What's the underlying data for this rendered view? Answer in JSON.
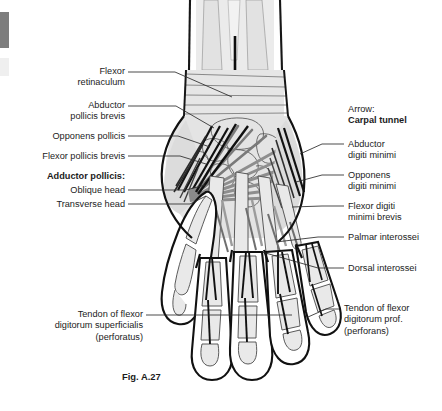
{
  "figure": {
    "caption": "Fig. A.27",
    "caption_x": 122,
    "caption_y": 371
  },
  "colors": {
    "background": "#ffffff",
    "text": "#1c1c1c",
    "outline": "#111111",
    "bone_fill": "#e9e9e9",
    "bone_line": "#4a4a4a",
    "muscle_gray": "#8c8c8c",
    "tendon_dark": "#141414",
    "leader": "#2a2a2a",
    "scan_artifact": "#7d7d7d"
  },
  "labels_left": [
    {
      "name": "flexor-retinaculum",
      "text": "Flexor\nretinaculum",
      "x": 18,
      "y": 66,
      "w": 107,
      "bold": false,
      "leader": [
        [
          128,
          72
        ],
        [
          175,
          72
        ],
        [
          232,
          97
        ]
      ]
    },
    {
      "name": "abductor-pollicis-brevis",
      "text": "Abductor\npollicis brevis",
      "x": 18,
      "y": 100,
      "w": 107,
      "bold": false,
      "leader": [
        [
          128,
          106
        ],
        [
          176,
          106
        ],
        [
          214,
          128
        ]
      ]
    },
    {
      "name": "opponens-pollicis",
      "text": "Opponens pollicis",
      "x": 18,
      "y": 131,
      "w": 107,
      "bold": false,
      "leader": [
        [
          128,
          136
        ],
        [
          178,
          136
        ],
        [
          210,
          147
        ]
      ]
    },
    {
      "name": "flexor-pollicis-brevis",
      "text": "Flexor pollicis brevis",
      "x": 12,
      "y": 151,
      "w": 113,
      "bold": false,
      "leader": [
        [
          128,
          156
        ],
        [
          180,
          156
        ],
        [
          206,
          164
        ]
      ]
    },
    {
      "name": "adductor-pollicis-heading",
      "text": "Adductor pollicis:",
      "x": 18,
      "y": 171,
      "w": 107,
      "bold": true,
      "leader": null
    },
    {
      "name": "adductor-pollicis-oblique-head",
      "text": "Oblique head",
      "x": 18,
      "y": 185,
      "w": 107,
      "bold": false,
      "leader": [
        [
          128,
          190
        ],
        [
          186,
          190
        ],
        [
          205,
          185
        ]
      ]
    },
    {
      "name": "adductor-pollicis-transverse-head",
      "text": "Transverse head",
      "x": 18,
      "y": 199,
      "w": 107,
      "bold": false,
      "leader": [
        [
          128,
          204
        ],
        [
          190,
          204
        ],
        [
          206,
          196
        ]
      ]
    }
  ],
  "labels_right": [
    {
      "name": "arrow-carpal-tunnel",
      "text_plain": "Arrow:",
      "text_bold": "Carpal tunnel",
      "x": 348,
      "y": 104,
      "w": 92,
      "leader": null
    },
    {
      "name": "abductor-digiti-minimi",
      "text": "Abductor\ndigiti minimi",
      "x": 348,
      "y": 139,
      "w": 92,
      "leader": [
        [
          344,
          144
        ],
        [
          322,
          144
        ],
        [
          300,
          154
        ]
      ]
    },
    {
      "name": "opponens-digiti-minimi",
      "text": "Opponens\ndigiti minimi",
      "x": 348,
      "y": 170,
      "w": 92,
      "leader": [
        [
          344,
          175
        ],
        [
          322,
          175
        ],
        [
          296,
          182
        ]
      ]
    },
    {
      "name": "flexor-digiti-minimi-brevis",
      "text": "Flexor digiti\nminimi brevis",
      "x": 348,
      "y": 201,
      "w": 92,
      "leader": [
        [
          344,
          206
        ],
        [
          322,
          206
        ],
        [
          292,
          207
        ]
      ]
    },
    {
      "name": "palmar-interossei",
      "text": "Palmar interossei",
      "x": 348,
      "y": 232,
      "w": 92,
      "leader": [
        [
          344,
          237
        ],
        [
          318,
          237
        ],
        [
          276,
          242
        ]
      ]
    },
    {
      "name": "dorsal-interossei",
      "text": "Dorsal interossei",
      "x": 348,
      "y": 263,
      "w": 92,
      "leader": [
        [
          344,
          268
        ],
        [
          318,
          268
        ],
        [
          262,
          252
        ]
      ]
    }
  ],
  "labels_bottom": [
    {
      "name": "tendon-flexor-digitorum-superficialis",
      "text": "Tendon of flexor\ndigitorum superficialis\n(perforatus)",
      "x": 8,
      "y": 309,
      "w": 135,
      "align": "right",
      "leader": [
        [
          146,
          315
        ],
        [
          230,
          315
        ],
        [
          292,
          315
        ]
      ]
    },
    {
      "name": "tendon-flexor-digitorum-profundus",
      "text": "Tendon of flexor\ndigitorum prof.\n(perforans)",
      "x": 344,
      "y": 303,
      "w": 96,
      "align": "left",
      "leader": [
        [
          340,
          309
        ],
        [
          326,
          309
        ],
        [
          308,
          317
        ]
      ]
    }
  ],
  "artifacts": [
    {
      "name": "scan-edge-bar-dark",
      "x": 0,
      "y": 12,
      "w": 9,
      "h": 36,
      "color": "#7d7d7d"
    },
    {
      "name": "scan-edge-bar-light",
      "x": 0,
      "y": 58,
      "w": 9,
      "h": 18,
      "color": "#efefef"
    }
  ]
}
